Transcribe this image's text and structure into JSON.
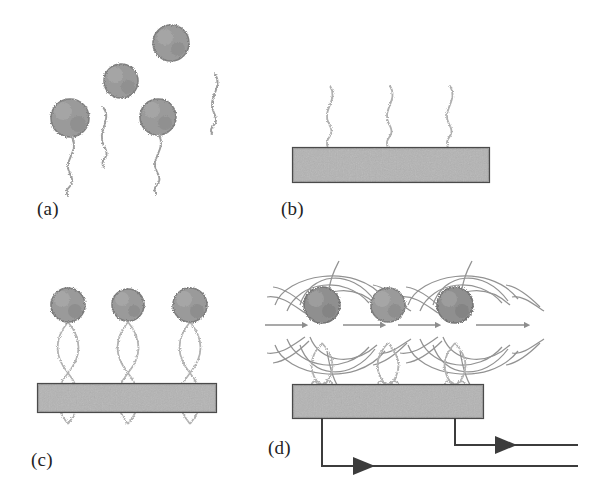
{
  "figure": {
    "background_color": "#ffffff",
    "ink_color": "#4a4a4a",
    "particle_fill": "#9a9a9a",
    "particle_edge": "#7d7d7d",
    "substrate_fill": "#b4b4b4",
    "substrate_edge": "#4a4a4a",
    "strand_color": "#a8a8a8",
    "field_line_color": "#8d8d8d",
    "wire_color": "#3c3c3c",
    "label_color": "#232323"
  },
  "panels": [
    {
      "id": "a",
      "label": "(a)",
      "caption_text": "(a)",
      "description": "Free magnetic nanoparticles and free single-stranded DNA probes dispersed in solution",
      "particles": [
        {
          "name": "particle-a-1",
          "cx": 70,
          "cy": 118,
          "r": 19,
          "has_tail": true
        },
        {
          "name": "particle-a-2",
          "cx": 121,
          "cy": 81,
          "r": 17,
          "has_tail": false
        },
        {
          "name": "particle-a-3",
          "cx": 158,
          "cy": 117,
          "r": 18,
          "has_tail": true
        },
        {
          "name": "particle-a-4",
          "cx": 171,
          "cy": 43,
          "r": 18,
          "has_tail": false
        }
      ],
      "free_strands": 2,
      "tethered_strands": 2
    },
    {
      "id": "b",
      "label": "(b)",
      "caption_text": "(b)",
      "description": "Single-stranded capture DNA probes immobilized on the sensor substrate surface",
      "substrate": {
        "x": 293,
        "y": 148,
        "width": 196,
        "height": 34
      },
      "strand_count": 3,
      "strand_x": [
        330,
        390,
        450
      ]
    },
    {
      "id": "c",
      "label": "(c)",
      "caption_text": "(c)",
      "description": "Hybridized double-stranded DNA with magnetic nanoparticle labels bound on the substrate",
      "substrate": {
        "x": 38,
        "y": 384,
        "width": 178,
        "height": 28
      },
      "helix_count": 3,
      "helix_x": [
        68,
        128,
        190
      ],
      "particles": [
        {
          "name": "particle-c-1",
          "cx": 68,
          "cy": 305,
          "r": 17
        },
        {
          "name": "particle-c-2",
          "cx": 128,
          "cy": 305,
          "r": 16
        },
        {
          "name": "particle-c-3",
          "cx": 190,
          "cy": 305,
          "r": 17
        }
      ]
    },
    {
      "id": "d",
      "label": "(d)",
      "caption_text": "(d)",
      "description": "Magnetized nanoparticles produce dipolar stray fields detected by the current-carrying sensor strips",
      "substrate": {
        "x": 293,
        "y": 385,
        "width": 190,
        "height": 33
      },
      "helix_count": 3,
      "helix_x": [
        322,
        388,
        455
      ],
      "particles": [
        {
          "name": "particle-d-1",
          "cx": 322,
          "cy": 305,
          "r": 18,
          "magnetized": true
        },
        {
          "name": "particle-d-2",
          "cx": 388,
          "cy": 305,
          "r": 17,
          "magnetized": false
        },
        {
          "name": "particle-d-3",
          "cx": 455,
          "cy": 305,
          "r": 18,
          "magnetized": true
        }
      ],
      "dipoles": [
        {
          "name": "dipole-field-left",
          "cx": 322,
          "cy": 305
        },
        {
          "name": "dipole-field-right",
          "cx": 455,
          "cy": 305
        }
      ],
      "current_wires": [
        {
          "name": "current-wire-lower",
          "from_x": 322,
          "drop_to_y": 466,
          "end_x": 578,
          "arrow_x": 372,
          "direction": "right"
        },
        {
          "name": "current-wire-upper",
          "from_x": 455,
          "drop_to_y": 445,
          "end_x": 578,
          "arrow_x": 512,
          "direction": "right"
        }
      ]
    }
  ]
}
